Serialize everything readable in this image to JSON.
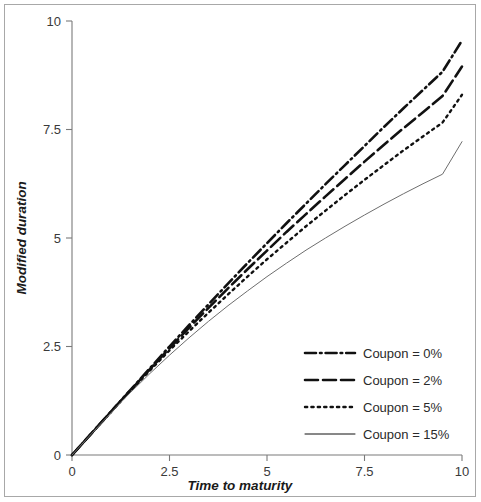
{
  "chart_data": {
    "type": "line",
    "title": "",
    "xlabel": "Time to maturity",
    "ylabel": "Modified duration",
    "xlim": [
      0,
      10
    ],
    "ylim": [
      0,
      10
    ],
    "xticks": [
      "0",
      "2.5",
      "5",
      "7.5",
      "10"
    ],
    "xtick_values": [
      0,
      2.5,
      5,
      7.5,
      10
    ],
    "yticks": [
      "0",
      "2.5",
      "5",
      "7.5",
      "10"
    ],
    "ytick_values": [
      0,
      2.5,
      5,
      7.5,
      10
    ],
    "grid": false,
    "legend_position": "lower-right",
    "x": [
      0,
      0.5,
      1,
      1.25,
      1.5,
      2,
      2.5,
      3,
      3.5,
      4,
      4.5,
      5,
      5.5,
      6,
      6.5,
      7,
      7.5,
      8,
      8.5,
      9,
      9.5,
      10
    ],
    "series": [
      {
        "name": "Coupon = 0%",
        "style": "dash-dot",
        "values": [
          0,
          0.5,
          1.0,
          1.25,
          1.5,
          2.0,
          2.5,
          2.99,
          3.47,
          3.95,
          4.42,
          4.88,
          5.34,
          5.79,
          6.24,
          6.68,
          7.12,
          7.56,
          7.99,
          8.41,
          8.83,
          9.55
        ]
      },
      {
        "name": "Coupon = 2%",
        "style": "long-dash",
        "values": [
          0,
          0.5,
          1.0,
          1.25,
          1.49,
          1.98,
          2.46,
          2.93,
          3.39,
          3.84,
          4.28,
          4.71,
          5.14,
          5.55,
          5.96,
          6.36,
          6.76,
          7.15,
          7.53,
          7.9,
          8.27,
          8.95
        ]
      },
      {
        "name": "Coupon = 5%",
        "style": "dotted",
        "values": [
          0,
          0.5,
          0.99,
          1.24,
          1.48,
          1.95,
          2.41,
          2.85,
          3.28,
          3.7,
          4.11,
          4.51,
          4.89,
          5.27,
          5.63,
          5.99,
          6.34,
          6.68,
          7.02,
          7.34,
          7.66,
          8.3
        ]
      },
      {
        "name": "Coupon = 15%",
        "style": "solid-thin",
        "values": [
          0,
          0.49,
          0.97,
          1.21,
          1.44,
          1.88,
          2.3,
          2.7,
          3.08,
          3.44,
          3.78,
          4.11,
          4.42,
          4.72,
          5.0,
          5.27,
          5.53,
          5.78,
          6.02,
          6.25,
          6.47,
          7.22
        ]
      }
    ]
  },
  "legend": {
    "items": [
      {
        "label": "Coupon = 0%"
      },
      {
        "label": "Coupon = 2%"
      },
      {
        "label": "Coupon = 5%"
      },
      {
        "label": "Coupon = 15%"
      }
    ]
  }
}
